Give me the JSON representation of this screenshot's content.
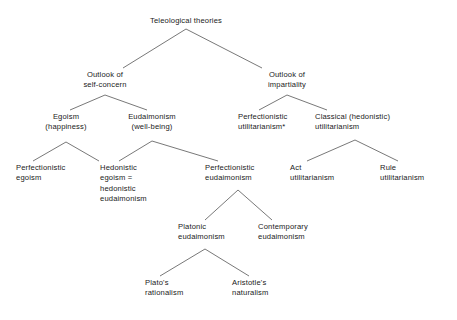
{
  "diagram": {
    "title": "Teleological theories",
    "type": "hierarchy-tree",
    "footnote_marker": "*",
    "line_color": "#555555",
    "text_color": "#1a1a1a",
    "background_color": "#ffffff",
    "nodes": {
      "root": {
        "id": "teleological-theories",
        "lines": [
          "Teleological theories"
        ],
        "x": 186,
        "y": 16,
        "align": "center",
        "level": 0
      },
      "outlook_self_concern": {
        "id": "outlook-of-self-concern",
        "lines": [
          "Outlook of",
          "self-concern"
        ],
        "x": 105,
        "y": 70,
        "align": "center",
        "level": 1
      },
      "outlook_impartiality": {
        "id": "outlook-of-impartiality",
        "lines": [
          "Outlook of",
          "impartiality"
        ],
        "x": 287,
        "y": 70,
        "align": "center",
        "level": 1
      },
      "egoism": {
        "id": "egoism-happiness",
        "lines": [
          "Egoism",
          "(happiness)"
        ],
        "x": 66,
        "y": 112,
        "align": "center",
        "level": 2
      },
      "eudaimonism": {
        "id": "eudaimonism-well-being",
        "lines": [
          "Eudaimonism",
          "(well-being)"
        ],
        "x": 152,
        "y": 112,
        "align": "center",
        "level": 2
      },
      "perfectionistic_utilitarianism": {
        "id": "perfectionistic-utilitarianism",
        "lines": [
          "Perfectionistic",
          "utilitarianism*"
        ],
        "x": 238,
        "y": 112,
        "align": "left",
        "level": 2
      },
      "classical_utilitarianism": {
        "id": "classical-hedonistic-utilitarianism",
        "lines": [
          "Classical (hedonistic)",
          "utilitarianism"
        ],
        "x": 315,
        "y": 112,
        "align": "left",
        "level": 2
      },
      "perfectionistic_egoism": {
        "id": "perfectionistic-egoism",
        "lines": [
          "Perfectionistic",
          "egoism"
        ],
        "x": 16,
        "y": 163,
        "align": "left",
        "level": 3
      },
      "hedonistic_egoism": {
        "id": "hedonistic-egoism",
        "lines": [
          "Hedonistic",
          "egoism =",
          "hedonistic",
          "eudaimonism"
        ],
        "x": 100,
        "y": 163,
        "align": "left",
        "level": 3
      },
      "perfectionistic_eudaimonism": {
        "id": "perfectionistic-eudaimonism",
        "lines": [
          "Perfectionistic",
          "eudaimonism"
        ],
        "x": 205,
        "y": 163,
        "align": "left",
        "level": 3
      },
      "act_utilitarianism": {
        "id": "act-utilitarianism",
        "lines": [
          "Act",
          "utilitarianism"
        ],
        "x": 290,
        "y": 163,
        "align": "left",
        "level": 3
      },
      "rule_utilitarianism": {
        "id": "rule-utilitarianism",
        "lines": [
          "Rule",
          "utilitarianism"
        ],
        "x": 380,
        "y": 163,
        "align": "left",
        "level": 3
      },
      "platonic_eudaimonism": {
        "id": "platonic-eudaimonism",
        "lines": [
          "Platonic",
          "eudaimonism"
        ],
        "x": 178,
        "y": 222,
        "align": "left",
        "level": 4
      },
      "contemporary_eudaimonism": {
        "id": "contemporary-eudaimonism",
        "lines": [
          "Contemporary",
          "eudaimonism"
        ],
        "x": 258,
        "y": 222,
        "align": "left",
        "level": 4
      },
      "platos_rationalism": {
        "id": "platos-rationalism",
        "lines": [
          "Plato's",
          "rationalism"
        ],
        "x": 145,
        "y": 278,
        "align": "left",
        "level": 5
      },
      "aristotles_naturalism": {
        "id": "aristotles-naturalism",
        "lines": [
          "Aristotle's",
          "naturalism"
        ],
        "x": 232,
        "y": 278,
        "align": "left",
        "level": 5
      }
    },
    "edges": [
      {
        "from": "teleological-theories",
        "to": "outlook-of-self-concern",
        "x1": 186,
        "y1": 29,
        "x2": 123,
        "y2": 68
      },
      {
        "from": "teleological-theories",
        "to": "outlook-of-impartiality",
        "x1": 186,
        "y1": 29,
        "x2": 262,
        "y2": 68
      },
      {
        "from": "outlook-of-self-concern",
        "to": "egoism-happiness",
        "x1": 105,
        "y1": 95,
        "x2": 70,
        "y2": 110
      },
      {
        "from": "outlook-of-self-concern",
        "to": "eudaimonism-well-being",
        "x1": 105,
        "y1": 95,
        "x2": 147,
        "y2": 110
      },
      {
        "from": "outlook-of-impartiality",
        "to": "perfectionistic-utilitarianism",
        "x1": 287,
        "y1": 95,
        "x2": 259,
        "y2": 110
      },
      {
        "from": "outlook-of-impartiality",
        "to": "classical-hedonistic-utilitarianism",
        "x1": 287,
        "y1": 95,
        "x2": 327,
        "y2": 110
      },
      {
        "from": "egoism-happiness",
        "to": "perfectionistic-egoism",
        "x1": 66,
        "y1": 142,
        "x2": 33,
        "y2": 161
      },
      {
        "from": "egoism-happiness",
        "to": "hedonistic-egoism",
        "x1": 66,
        "y1": 142,
        "x2": 99,
        "y2": 161
      },
      {
        "from": "eudaimonism-well-being",
        "to": "hedonistic-egoism",
        "x1": 152,
        "y1": 141,
        "x2": 119,
        "y2": 161
      },
      {
        "from": "eudaimonism-well-being",
        "to": "perfectionistic-eudaimonism",
        "x1": 152,
        "y1": 141,
        "x2": 218,
        "y2": 161
      },
      {
        "from": "classical-hedonistic-utilitarianism",
        "to": "act-utilitarianism",
        "x1": 355,
        "y1": 140,
        "x2": 307,
        "y2": 161
      },
      {
        "from": "classical-hedonistic-utilitarianism",
        "to": "rule-utilitarianism",
        "x1": 355,
        "y1": 140,
        "x2": 398,
        "y2": 161
      },
      {
        "from": "perfectionistic-eudaimonism",
        "to": "platonic-eudaimonism",
        "x1": 238,
        "y1": 190,
        "x2": 205,
        "y2": 220
      },
      {
        "from": "perfectionistic-eudaimonism",
        "to": "contemporary-eudaimonism",
        "x1": 238,
        "y1": 190,
        "x2": 272,
        "y2": 220
      },
      {
        "from": "platonic-eudaimonism",
        "to": "platos-rationalism",
        "x1": 205,
        "y1": 249,
        "x2": 160,
        "y2": 276
      },
      {
        "from": "platonic-eudaimonism",
        "to": "aristotles-naturalism",
        "x1": 205,
        "y1": 249,
        "x2": 249,
        "y2": 276
      }
    ]
  }
}
